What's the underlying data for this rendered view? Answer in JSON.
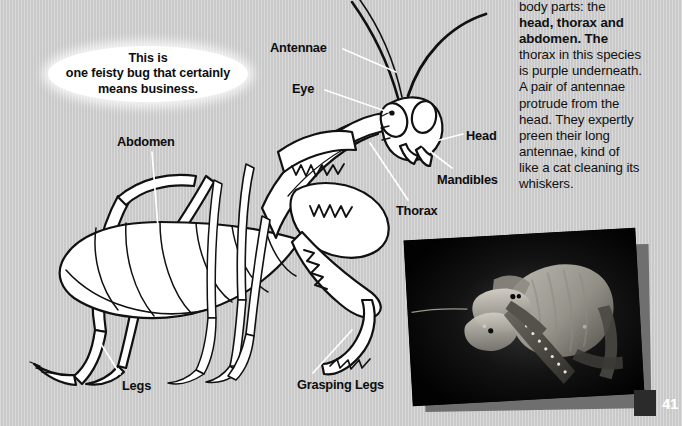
{
  "page": {
    "number": "41",
    "background_color": "#cdcdcd"
  },
  "body_copy": {
    "lines": [
      "body parts: the",
      "head, thorax and",
      "abdomen. The",
      "thorax in this species",
      "is purple underneath.",
      "A pair of antennae",
      "protrude from the",
      "head. They expertly",
      "preen their long",
      "antennae, kind of",
      "like a cat cleaning its",
      "whiskers."
    ],
    "bold_terms": [
      "head",
      "thorax",
      "abdomen",
      "antennae"
    ],
    "full_text": "body parts: the head, thorax and abdomen. The thorax in this species is purple underneath. A pair of antennae protrude from the head. They expertly preen their long antennae, kind of like a cat cleaning its whiskers."
  },
  "callout_bubble": {
    "text": "This is\none feisty bug that certainly\nmeans business."
  },
  "diagram": {
    "labels": [
      {
        "id": "antennae",
        "text": "Antennae",
        "x": 270,
        "y": 40
      },
      {
        "id": "eye",
        "text": "Eye",
        "x": 292,
        "y": 81
      },
      {
        "id": "head",
        "text": "Head",
        "x": 466,
        "y": 128
      },
      {
        "id": "mandibles",
        "text": "Mandibles",
        "x": 437,
        "y": 172
      },
      {
        "id": "thorax",
        "text": "Thorax",
        "x": 396,
        "y": 203
      },
      {
        "id": "abdomen",
        "text": "Abdomen",
        "x": 117,
        "y": 134
      },
      {
        "id": "legs",
        "text": "Legs",
        "x": 122,
        "y": 378
      },
      {
        "id": "grasping-legs",
        "text": "Grasping Legs",
        "x": 297,
        "y": 377
      }
    ],
    "leader_line_color": "#ffffff",
    "line_art_color": "#111111",
    "fill_color": "#ffffff"
  },
  "photo_inset": {
    "caption": "",
    "description": "close-up photograph of a mantis head and raptorial foreleg on black background",
    "frame_color": "#050505",
    "shadow_color": "#6f6f6f"
  }
}
